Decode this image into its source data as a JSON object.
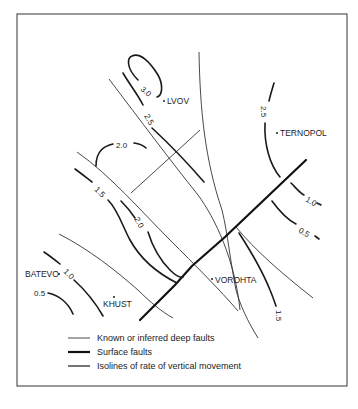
{
  "map": {
    "cities": [
      {
        "name": "LVOV",
        "x": 166,
        "y": 104
      },
      {
        "name": "TERNOPOL",
        "x": 277,
        "y": 133
      },
      {
        "name": "VOROHTA",
        "x": 212,
        "y": 280
      },
      {
        "name": "BATEVO",
        "x": 60,
        "y": 275
      },
      {
        "name": "KHUST",
        "x": 115,
        "y": 298
      }
    ],
    "isoline_labels": [
      {
        "text": "3.0",
        "x": 140,
        "y": 90,
        "rotate": 40
      },
      {
        "text": "2.5",
        "x": 145,
        "y": 118,
        "rotate": 60
      },
      {
        "text": "2.0",
        "x": 118,
        "y": 148,
        "rotate": 0
      },
      {
        "text": "1.5",
        "x": 94,
        "y": 193,
        "rotate": 45
      },
      {
        "text": "2.0",
        "x": 135,
        "y": 222,
        "rotate": 60
      },
      {
        "text": "1.0",
        "x": 62,
        "y": 274,
        "rotate": 45
      },
      {
        "text": "0.5",
        "x": 34,
        "y": 294,
        "rotate": 0
      },
      {
        "text": "2.5",
        "x": 260,
        "y": 108,
        "rotate": 90
      },
      {
        "text": "1.0",
        "x": 306,
        "y": 202,
        "rotate": 30
      },
      {
        "text": "0.5",
        "x": 299,
        "y": 233,
        "rotate": 30
      },
      {
        "text": "1.5",
        "x": 277,
        "y": 312,
        "rotate": 90
      }
    ]
  },
  "legend": {
    "items": [
      {
        "label": "Known or inferred deep faults",
        "style": "deep"
      },
      {
        "label": "Surface faults",
        "style": "surface"
      },
      {
        "label": "Isolines of rate of vertical movement",
        "style": "isoline"
      }
    ]
  },
  "colors": {
    "background": "#ffffff",
    "lines": "#1a1a1a",
    "frame": "#555555"
  }
}
